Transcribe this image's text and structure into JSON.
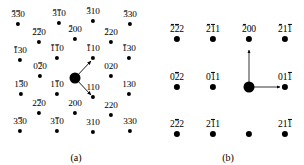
{
  "figure": {
    "panels": [
      {
        "id": "a",
        "caption": "(a)",
        "pattern_type": "oblique",
        "spots": [
          {
            "name": "spot-3b3b0",
            "label": "3̅3̅0",
            "indices": [
              -3,
              -3,
              0
            ],
            "x": 18,
            "y": 24,
            "size": "small",
            "label_dx": 0,
            "label_dy": -4
          },
          {
            "name": "spot-3b1b0",
            "label": "3̅1̅0",
            "indices": [
              -3,
              -1,
              0
            ],
            "x": 59,
            "y": 23,
            "size": "small",
            "label_dx": 0,
            "label_dy": -4
          },
          {
            "name": "spot-3b10",
            "label": "3̅10",
            "indices": [
              -3,
              1,
              0
            ],
            "x": 93,
            "y": 21,
            "size": "small",
            "label_dx": 0,
            "label_dy": -4
          },
          {
            "name": "spot-3b30",
            "label": "3̅30",
            "indices": [
              -3,
              3,
              0
            ],
            "x": 130,
            "y": 24,
            "size": "small",
            "label_dx": 0,
            "label_dy": -4
          },
          {
            "name": "spot-2b2b0",
            "label": "2̅2̅0",
            "indices": [
              -2,
              -2,
              0
            ],
            "x": 39,
            "y": 42,
            "size": "small",
            "label_dx": 0,
            "label_dy": -4
          },
          {
            "name": "spot-2b00",
            "label": "2̅00",
            "indices": [
              -2,
              0,
              0
            ],
            "x": 75,
            "y": 39,
            "size": "small",
            "label_dx": 0,
            "label_dy": -4
          },
          {
            "name": "spot-2b20",
            "label": "2̅20",
            "indices": [
              -2,
              2,
              0
            ],
            "x": 111,
            "y": 42,
            "size": "small",
            "label_dx": 0,
            "label_dy": -4
          },
          {
            "name": "spot-1b30",
            "label": "1̅30",
            "indices": [
              -1,
              3,
              0
            ],
            "x": 20,
            "y": 60,
            "size": "small",
            "label_dx": 0,
            "label_dy": -4
          },
          {
            "name": "spot-1b1b0",
            "label": "1̅1̅0",
            "indices": [
              -1,
              -1,
              0
            ],
            "x": 57,
            "y": 58,
            "size": "small",
            "label_dx": 0,
            "label_dy": -4
          },
          {
            "name": "spot-1b10",
            "label": "1̅10",
            "indices": [
              -1,
              1,
              0
            ],
            "x": 93,
            "y": 58,
            "size": "small",
            "label_dx": 0,
            "label_dy": -4
          },
          {
            "name": "spot-1b30r",
            "label": "1̅30",
            "indices": [
              -1,
              3,
              0
            ],
            "x": 129,
            "y": 58,
            "size": "small",
            "label_dx": 0,
            "label_dy": -4
          },
          {
            "name": "spot-02b0",
            "label": "02̅0",
            "indices": [
              0,
              -2,
              0
            ],
            "x": 40,
            "y": 76,
            "size": "small",
            "label_dx": 0,
            "label_dy": -4
          },
          {
            "name": "spot-000",
            "label": "",
            "indices": [
              0,
              0,
              0
            ],
            "x": 75,
            "y": 78,
            "size": "center",
            "label_dx": 0,
            "label_dy": 0
          },
          {
            "name": "spot-020",
            "label": "020",
            "indices": [
              0,
              2,
              0
            ],
            "x": 111,
            "y": 76,
            "size": "small",
            "label_dx": 0,
            "label_dy": -4
          },
          {
            "name": "spot-13b0",
            "label": "13̅0",
            "indices": [
              1,
              -3,
              0
            ],
            "x": 21,
            "y": 94,
            "size": "small",
            "label_dx": 0,
            "label_dy": -4
          },
          {
            "name": "spot-11b0",
            "label": "11̅0",
            "indices": [
              1,
              -1,
              0
            ],
            "x": 57,
            "y": 94,
            "size": "small",
            "label_dx": 0,
            "label_dy": -4
          },
          {
            "name": "spot-110",
            "label": "110",
            "indices": [
              1,
              1,
              0
            ],
            "x": 93,
            "y": 97,
            "size": "small",
            "label_dx": 0,
            "label_dy": -4
          },
          {
            "name": "spot-130",
            "label": "130",
            "indices": [
              1,
              3,
              0
            ],
            "x": 129,
            "y": 94,
            "size": "small",
            "label_dx": 0,
            "label_dy": -4
          },
          {
            "name": "spot-22b0",
            "label": "22̅0",
            "indices": [
              2,
              -2,
              0
            ],
            "x": 39,
            "y": 113,
            "size": "small",
            "label_dx": 0,
            "label_dy": -4
          },
          {
            "name": "spot-200",
            "label": "200",
            "indices": [
              2,
              0,
              0
            ],
            "x": 75,
            "y": 113,
            "size": "small",
            "label_dx": 0,
            "label_dy": -4
          },
          {
            "name": "spot-220",
            "label": "220",
            "indices": [
              2,
              2,
              0
            ],
            "x": 111,
            "y": 115,
            "size": "small",
            "label_dx": 0,
            "label_dy": -4
          },
          {
            "name": "spot-33b0",
            "label": "33̅0",
            "indices": [
              3,
              -3,
              0
            ],
            "x": 20,
            "y": 131,
            "size": "small",
            "label_dx": 0,
            "label_dy": -4
          },
          {
            "name": "spot-31b0",
            "label": "31̅0",
            "indices": [
              3,
              -1,
              0
            ],
            "x": 57,
            "y": 131,
            "size": "small",
            "label_dx": 0,
            "label_dy": -4
          },
          {
            "name": "spot-310",
            "label": "310",
            "indices": [
              3,
              1,
              0
            ],
            "x": 93,
            "y": 132,
            "size": "small",
            "label_dx": 0,
            "label_dy": -4
          },
          {
            "name": "spot-330",
            "label": "330",
            "indices": [
              3,
              3,
              0
            ],
            "x": 130,
            "y": 131,
            "size": "small",
            "label_dx": 0,
            "label_dy": -4
          }
        ],
        "vectors": [
          {
            "name": "vector-1b10",
            "from": [
              75,
              78
            ],
            "to": [
              91,
              61
            ],
            "target_label": "1̅10"
          },
          {
            "name": "vector-110",
            "from": [
              75,
              78
            ],
            "to": [
              91,
              95
            ],
            "target_label": "110"
          }
        ]
      },
      {
        "id": "b",
        "caption": "(b)",
        "pattern_type": "rectangular",
        "spots": [
          {
            "name": "spot-2b2b2",
            "label": "2̅2̅2",
            "indices": [
              -2,
              -2,
              2
            ],
            "x": 25,
            "y": 39,
            "size": "medium",
            "label_dx": 0,
            "label_dy": -5
          },
          {
            "name": "spot-2b11",
            "label": "2̅1̅1",
            "indices": [
              -2,
              -1,
              1
            ],
            "x": 61,
            "y": 39,
            "size": "medium",
            "label_dx": 0,
            "label_dy": -5
          },
          {
            "name": "spot-2b00",
            "label": "2̅00",
            "indices": [
              -2,
              0,
              0
            ],
            "x": 97,
            "y": 39,
            "size": "medium",
            "label_dx": 0,
            "label_dy": -5
          },
          {
            "name": "spot-2b11b",
            "label": "2̅11̅",
            "indices": [
              -2,
              1,
              -1
            ],
            "x": 133,
            "y": 39,
            "size": "medium",
            "label_dx": 0,
            "label_dy": -5
          },
          {
            "name": "spot-2b22b",
            "label": "2̅22̅",
            "indices": [
              -2,
              2,
              -2
            ],
            "x": 169,
            "y": 39,
            "size": "medium",
            "label_dx": 0,
            "label_dy": -5
          },
          {
            "name": "spot-022b",
            "label": "02̅2",
            "indices": [
              0,
              -2,
              2
            ],
            "x": 25,
            "y": 87,
            "size": "medium",
            "label_dx": 0,
            "label_dy": -5
          },
          {
            "name": "spot-01b1",
            "label": "01̅1",
            "indices": [
              0,
              -1,
              1
            ],
            "x": 61,
            "y": 87,
            "size": "medium",
            "label_dx": 0,
            "label_dy": -5
          },
          {
            "name": "spot-000",
            "label": "",
            "indices": [
              0,
              0,
              0
            ],
            "x": 97,
            "y": 87,
            "size": "center",
            "label_dx": 0,
            "label_dy": 0
          },
          {
            "name": "spot-011b",
            "label": "011̅",
            "indices": [
              0,
              1,
              -1
            ],
            "x": 133,
            "y": 87,
            "size": "medium",
            "label_dx": 0,
            "label_dy": -5
          },
          {
            "name": "spot-022bb",
            "label": "022̅",
            "indices": [
              0,
              2,
              -2
            ],
            "x": 169,
            "y": 87,
            "size": "medium",
            "label_dx": 0,
            "label_dy": -5
          },
          {
            "name": "spot-22b2",
            "label": "22̅2",
            "indices": [
              2,
              -2,
              2
            ],
            "x": 25,
            "y": 134,
            "size": "medium",
            "label_dx": 0,
            "label_dy": -5
          },
          {
            "name": "spot-21b1",
            "label": "21̅1",
            "indices": [
              2,
              -1,
              1
            ],
            "x": 61,
            "y": 134,
            "size": "medium",
            "label_dx": 0,
            "label_dy": -5
          },
          {
            "name": "spot-200u",
            "label": "",
            "indices": [
              2,
              0,
              0
            ],
            "x": 97,
            "y": 134,
            "size": "medium",
            "label_dx": 0,
            "label_dy": -5
          },
          {
            "name": "spot-211b",
            "label": "211̅",
            "indices": [
              2,
              1,
              -1
            ],
            "x": 133,
            "y": 134,
            "size": "medium",
            "label_dx": 0,
            "label_dy": -5
          },
          {
            "name": "spot-222b",
            "label": "222̅",
            "indices": [
              2,
              2,
              -2
            ],
            "x": 169,
            "y": 134,
            "size": "medium",
            "label_dx": 0,
            "label_dy": -5
          }
        ],
        "vectors": [
          {
            "name": "vector-2b00",
            "from": [
              97,
              87
            ],
            "to": [
              97,
              50
            ],
            "target_label": "2̅00"
          },
          {
            "name": "vector-011b",
            "from": [
              97,
              87
            ],
            "to": [
              128,
              87
            ],
            "target_label": "011̅"
          }
        ]
      }
    ]
  }
}
